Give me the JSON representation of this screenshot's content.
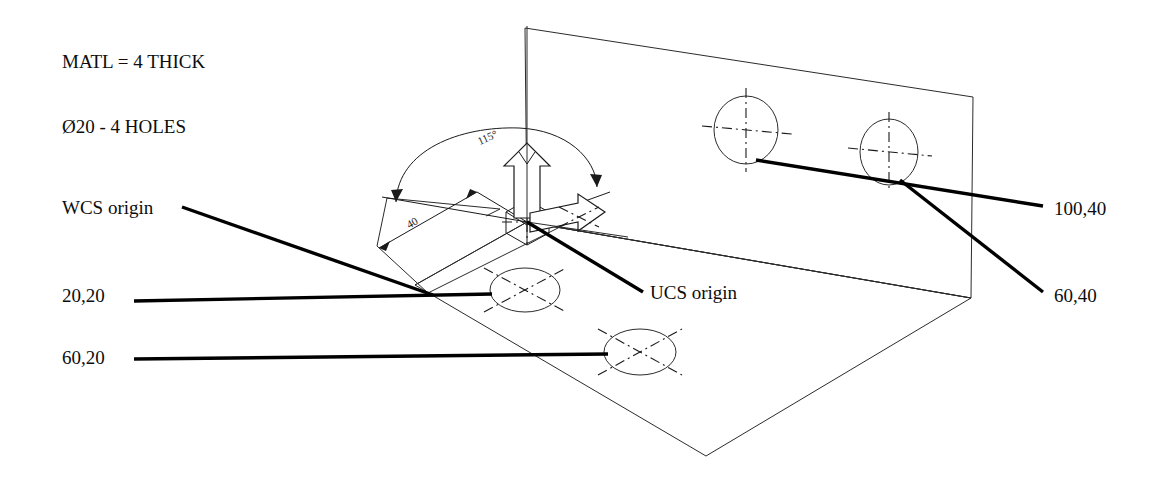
{
  "drawing": {
    "title": "Isometric plate drawing with WCS and UCS origins",
    "background_color": "#ffffff",
    "line_color": "#1a1a1a",
    "leader_color": "#000000",
    "notes": [
      {
        "id": "material-note",
        "text": "MATL = 4 THICK",
        "x": 62,
        "y": 68
      },
      {
        "id": "hole-note",
        "text": "Ø20 - 4 HOLES",
        "x": 62,
        "y": 133
      }
    ],
    "labels": [
      {
        "id": "wcs-origin-label",
        "text": "WCS origin",
        "x": 62,
        "y": 214,
        "anchor": "start"
      },
      {
        "id": "ucs-origin-label",
        "text": "UCS origin",
        "x": 650,
        "y": 299,
        "anchor": "start"
      },
      {
        "id": "hole-20-20-label",
        "text": "20,20",
        "x": 62,
        "y": 302,
        "anchor": "start"
      },
      {
        "id": "hole-60-20-label",
        "text": "60,20",
        "x": 62,
        "y": 364,
        "anchor": "start"
      },
      {
        "id": "hole-100-40-label",
        "text": "100,40",
        "x": 1054,
        "y": 215,
        "anchor": "start"
      },
      {
        "id": "hole-60-40-label",
        "text": "60,40",
        "x": 1054,
        "y": 302,
        "anchor": "start"
      }
    ],
    "dimensions": [
      {
        "id": "angle-dimension",
        "text": "115°",
        "x": 489,
        "y": 141,
        "rotation": -24,
        "font_size": 11
      },
      {
        "id": "length-dimension",
        "text": "40",
        "x": 414,
        "y": 226,
        "rotation": -30,
        "font_size": 11
      }
    ],
    "holes": {
      "vertical_face": [
        {
          "id": "hole-100-40",
          "cx": 746,
          "cy": 130,
          "rx": 32,
          "ry": 34,
          "coordinate": "100,40"
        },
        {
          "id": "hole-60-40",
          "cx": 889,
          "cy": 152,
          "rx": 29,
          "ry": 33,
          "coordinate": "60,40"
        }
      ],
      "base_face": [
        {
          "id": "hole-20-20",
          "cx": 525,
          "cy": 290,
          "rx": 35,
          "ry": 22,
          "coordinate": "20,20"
        },
        {
          "id": "hole-60-20",
          "cx": 640,
          "cy": 352,
          "rx": 36,
          "ry": 23,
          "coordinate": "60,20"
        }
      ]
    },
    "axes": {
      "z_arrow_label": "Z up arrow",
      "x_arrow_label": "X right arrow"
    },
    "leaders": [
      {
        "id": "leader-wcs",
        "x1": 182,
        "y1": 207,
        "x2": 433,
        "y2": 295
      },
      {
        "id": "leader-ucs",
        "x1": 643,
        "y1": 292,
        "x2": 527,
        "y2": 222
      },
      {
        "id": "leader-20-20",
        "x1": 134,
        "y1": 301,
        "x2": 492,
        "y2": 294
      },
      {
        "id": "leader-60-20",
        "x1": 134,
        "y1": 359,
        "x2": 608,
        "y2": 354
      },
      {
        "id": "leader-100-40",
        "x1": 1043,
        "y1": 206,
        "x2": 756,
        "y2": 160
      },
      {
        "id": "leader-60-40",
        "x1": 1043,
        "y1": 292,
        "x2": 900,
        "y2": 180
      }
    ]
  }
}
